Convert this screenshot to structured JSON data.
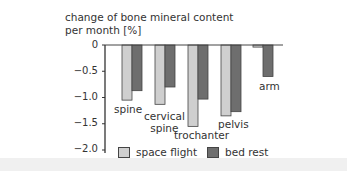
{
  "chart_data": {
    "type": "bar",
    "title": "change of bone mineral content per month [%]",
    "title_lines": [
      "change of bone mineral content",
      "per month [%]"
    ],
    "xlabel": "",
    "ylabel": "change of bone mineral content per month [%]",
    "ylim": [
      -2.0,
      0
    ],
    "yticks": [
      0,
      -0.5,
      -1.0,
      -1.5,
      -2.0
    ],
    "ytick_labels": [
      "0",
      "−0.5",
      "−1.0",
      "−1.5",
      "−2.0"
    ],
    "categories": [
      "spine",
      "cervical spine",
      "trochanter",
      "pelvis",
      "arm"
    ],
    "series": [
      {
        "name": "space flight",
        "color": "#cfcfcf",
        "values": [
          -1.05,
          -1.13,
          -1.55,
          -1.35,
          -0.04
        ]
      },
      {
        "name": "bed rest",
        "color": "#6e6e6e",
        "values": [
          -0.87,
          -0.8,
          -1.03,
          -1.27,
          -0.6
        ]
      }
    ],
    "legend_position": "bottom",
    "grid": false
  },
  "labels": {
    "title_line1": "change of bone mineral content",
    "title_line2": "per month [%]",
    "y0": "0",
    "y1": "−0.5",
    "y2": "−1.0",
    "y3": "−1.5",
    "y4": "−2.0",
    "cat_spine": "spine",
    "cat_cervical_1": "cervical",
    "cat_cervical_2": "spine",
    "cat_trochanter": "trochanter",
    "cat_pelvis": "pelvis",
    "cat_arm": "arm",
    "legend_space": "space flight",
    "legend_bed": "bed rest"
  }
}
